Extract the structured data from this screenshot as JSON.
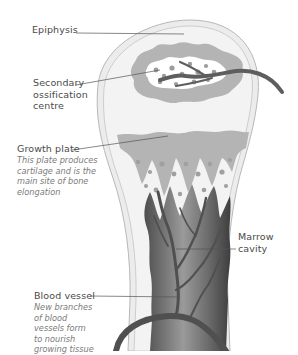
{
  "diagram": {
    "colors": {
      "bone_outline": "#b8b8b8",
      "cortex_fill": "#ececec",
      "epiphysis_fill": "#f2f2f2",
      "cartilage_fill": "#b4b4b4",
      "spongy_bone_fill": "#ffffff",
      "marrow_dark": "#5a5a5a",
      "marrow_light": "#a8a8a8",
      "blood_vessel": "#5e5e5e",
      "leader_line": "#555555",
      "label_text": "#4a4a4a",
      "description_text": "#7a7a7a"
    }
  },
  "labels": {
    "epiphysis": {
      "title": "Epiphysis"
    },
    "secondary_ossification": {
      "title": "Secondary ossification centre"
    },
    "growth_plate": {
      "title": "Growth plate",
      "description": "This plate produces cartilage and is the main site of bone elongation"
    },
    "marrow_cavity": {
      "title": "Marrow cavity"
    },
    "blood_vessel": {
      "title": "Blood vessel",
      "description": "New branches of blood vessels form to nourish growing tissue"
    }
  }
}
